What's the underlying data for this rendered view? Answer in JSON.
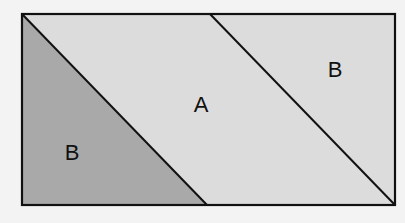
{
  "diagram": {
    "colors": {
      "background": "#f3f3f3",
      "region_light": "#dcdcdc",
      "region_dark": "#a9a9a9",
      "stroke": "#111111"
    },
    "regions": [
      {
        "id": "left-triangle",
        "label": "B",
        "shade": "dark"
      },
      {
        "id": "parallelogram",
        "label": "A",
        "shade": "light"
      },
      {
        "id": "right-triangle",
        "label": "B",
        "shade": "light"
      }
    ]
  }
}
